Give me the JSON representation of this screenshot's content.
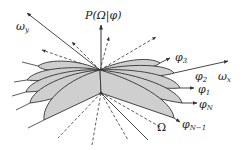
{
  "diagram": {
    "title_axis_label": "P(Ω|φ)",
    "axis_x_label": "ω",
    "axis_x_sub": "x",
    "axis_y_label": "ω",
    "axis_y_sub": "y",
    "omega_label": "Ω",
    "lobe_labels": [
      {
        "base": "φ",
        "sub": "3"
      },
      {
        "base": "φ",
        "sub": "2"
      },
      {
        "base": "φ",
        "sub": "1"
      },
      {
        "base": "φ",
        "sub": "N"
      },
      {
        "base": "φ",
        "sub": "N−1"
      }
    ],
    "colors": {
      "lobe_fill": "#cfcfcf",
      "stroke": "#333333",
      "background": "#ffffff"
    }
  }
}
